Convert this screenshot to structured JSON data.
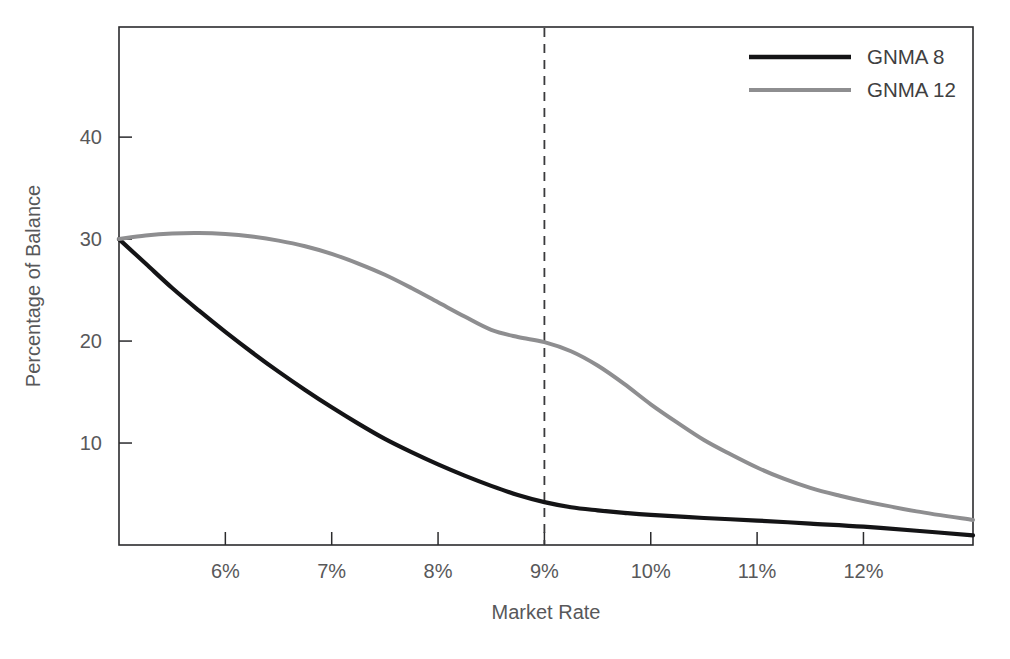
{
  "chart_data": {
    "type": "line",
    "title": "",
    "xlabel": "Market Rate",
    "ylabel": "Percentage of Balance",
    "xlim": [
      5.0,
      13.03
    ],
    "ylim": [
      0,
      50.8
    ],
    "grid": false,
    "legend_position": "top-right",
    "xticks": [
      6,
      7,
      8,
      9,
      10,
      11,
      12
    ],
    "xtick_labels": [
      "6%",
      "7%",
      "8%",
      "9%",
      "10%",
      "11%",
      "12%"
    ],
    "yticks": [
      10,
      20,
      30,
      40
    ],
    "ytick_labels": [
      "10",
      "20",
      "30",
      "40"
    ],
    "annotations": [
      {
        "name": "market-rate-marker",
        "type": "vertical-dashed-line",
        "x": 9,
        "label": ""
      }
    ],
    "series": [
      {
        "name": "GNMA 8",
        "color": "#141416",
        "line_width": 4.2,
        "x": [
          5.0,
          5.25,
          5.5,
          5.75,
          6.0,
          6.25,
          6.5,
          6.75,
          7.0,
          7.25,
          7.5,
          7.75,
          8.0,
          8.25,
          8.5,
          8.75,
          9.0,
          9.25,
          9.5,
          9.75,
          10.0,
          10.5,
          11.0,
          11.5,
          12.0,
          12.5,
          13.03
        ],
        "values": [
          30.0,
          27.6,
          25.2,
          23.0,
          20.9,
          18.9,
          17.0,
          15.2,
          13.5,
          11.9,
          10.4,
          9.1,
          7.9,
          6.8,
          5.8,
          4.9,
          4.2,
          3.7,
          3.4,
          3.15,
          2.95,
          2.65,
          2.4,
          2.1,
          1.8,
          1.4,
          0.95
        ]
      },
      {
        "name": "GNMA 12",
        "color": "#8e8e90",
        "line_width": 4.0,
        "x": [
          5.0,
          5.25,
          5.5,
          5.75,
          6.0,
          6.25,
          6.5,
          6.75,
          7.0,
          7.25,
          7.5,
          7.75,
          8.0,
          8.25,
          8.5,
          8.75,
          9.0,
          9.25,
          9.5,
          9.75,
          10.0,
          10.25,
          10.5,
          10.75,
          11.0,
          11.25,
          11.5,
          11.75,
          12.0,
          12.5,
          13.03
        ],
        "values": [
          30.0,
          30.35,
          30.55,
          30.6,
          30.5,
          30.25,
          29.85,
          29.3,
          28.55,
          27.6,
          26.5,
          25.2,
          23.8,
          22.4,
          21.1,
          20.4,
          19.9,
          19.0,
          17.6,
          15.8,
          13.8,
          12.0,
          10.3,
          8.9,
          7.6,
          6.5,
          5.6,
          4.9,
          4.3,
          3.3,
          2.45
        ]
      }
    ]
  },
  "legend": {
    "entries": [
      {
        "label": "GNMA 8",
        "color": "#141416"
      },
      {
        "label": "GNMA 12",
        "color": "#8e8e90"
      }
    ]
  }
}
